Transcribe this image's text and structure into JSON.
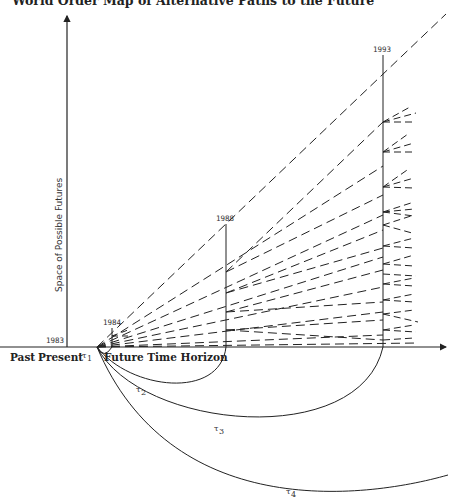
{
  "title": "World Order Map of Alternative Paths to the Future",
  "axes": {
    "y_label": "Space of Possible Futures",
    "x_labels": {
      "past": "Past",
      "present": "Present",
      "future": "Future Time Horizon"
    }
  },
  "time_markers": [
    {
      "year": "1983"
    },
    {
      "year": "1984"
    },
    {
      "year": "1988"
    },
    {
      "year": "1993"
    }
  ],
  "arcs": [
    {
      "label": "τ",
      "sub": "1"
    },
    {
      "label": "τ",
      "sub": "2"
    },
    {
      "label": "τ",
      "sub": "3"
    },
    {
      "label": "τ",
      "sub": "4"
    }
  ],
  "colors": {
    "ink": "#222222",
    "background": "#ffffff"
  }
}
